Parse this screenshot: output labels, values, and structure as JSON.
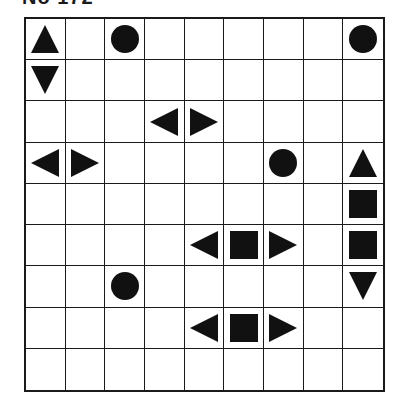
{
  "header": {
    "label": "No 172"
  },
  "board": {
    "rows": 9,
    "cols": 9,
    "colors": {
      "grid": "#1a1a1a",
      "shape": "#111111",
      "background": "#ffffff"
    },
    "pieces": [
      {
        "row": 0,
        "col": 0,
        "shape": "triangle-up"
      },
      {
        "row": 0,
        "col": 2,
        "shape": "circle"
      },
      {
        "row": 0,
        "col": 8,
        "shape": "circle"
      },
      {
        "row": 1,
        "col": 0,
        "shape": "triangle-down"
      },
      {
        "row": 2,
        "col": 3,
        "shape": "triangle-left"
      },
      {
        "row": 2,
        "col": 4,
        "shape": "triangle-right"
      },
      {
        "row": 3,
        "col": 0,
        "shape": "triangle-left"
      },
      {
        "row": 3,
        "col": 1,
        "shape": "triangle-right"
      },
      {
        "row": 3,
        "col": 6,
        "shape": "circle"
      },
      {
        "row": 3,
        "col": 8,
        "shape": "triangle-up"
      },
      {
        "row": 4,
        "col": 8,
        "shape": "square"
      },
      {
        "row": 5,
        "col": 4,
        "shape": "triangle-left"
      },
      {
        "row": 5,
        "col": 5,
        "shape": "square"
      },
      {
        "row": 5,
        "col": 6,
        "shape": "triangle-right"
      },
      {
        "row": 5,
        "col": 8,
        "shape": "square"
      },
      {
        "row": 6,
        "col": 2,
        "shape": "circle"
      },
      {
        "row": 6,
        "col": 8,
        "shape": "triangle-down"
      },
      {
        "row": 7,
        "col": 4,
        "shape": "triangle-left"
      },
      {
        "row": 7,
        "col": 5,
        "shape": "square"
      },
      {
        "row": 7,
        "col": 6,
        "shape": "triangle-right"
      }
    ]
  }
}
